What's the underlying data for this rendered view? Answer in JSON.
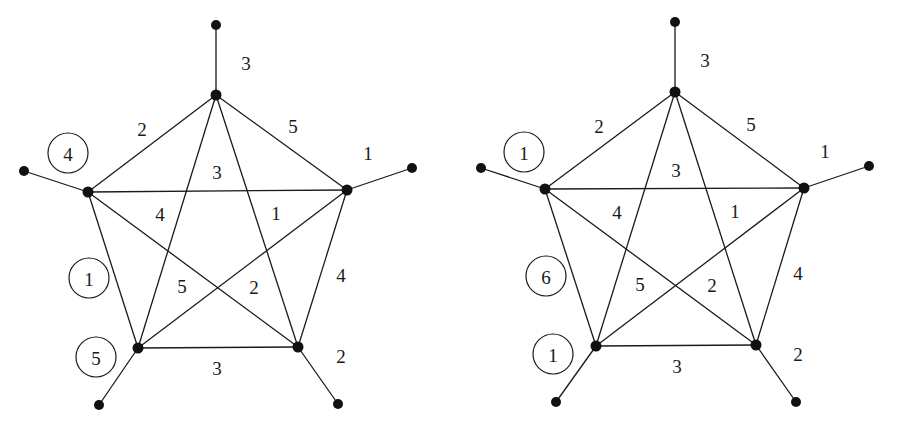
{
  "graphs": [
    {
      "name": "left",
      "vertices": {
        "T": [
          216,
          95
        ],
        "L": [
          88,
          192
        ],
        "R": [
          347,
          190
        ],
        "BL": [
          138,
          348
        ],
        "BR": [
          298,
          347
        ],
        "pT": [
          216,
          25
        ],
        "pL": [
          24,
          171
        ],
        "pR": [
          412,
          168
        ],
        "pBL": [
          99,
          405
        ],
        "pBR": [
          338,
          404
        ]
      },
      "edges": [
        {
          "a": "T",
          "b": "pT",
          "w": "3",
          "lx": 246,
          "ly": 63
        },
        {
          "a": "R",
          "b": "pR",
          "w": "1",
          "lx": 368,
          "ly": 153
        },
        {
          "a": "BR",
          "b": "pBR",
          "w": "2",
          "lx": 341,
          "ly": 356
        },
        {
          "a": "BL",
          "b": "pBL",
          "w": "",
          "lx": 0,
          "ly": 0
        },
        {
          "a": "L",
          "b": "pL",
          "w": "",
          "lx": 0,
          "ly": 0
        },
        {
          "a": "T",
          "b": "L",
          "w": "2",
          "lx": 142,
          "ly": 129
        },
        {
          "a": "T",
          "b": "R",
          "w": "5",
          "lx": 293,
          "ly": 126
        },
        {
          "a": "L",
          "b": "R",
          "w": "3",
          "lx": 217,
          "ly": 172
        },
        {
          "a": "L",
          "b": "BL",
          "w": "",
          "lx": 0,
          "ly": 0
        },
        {
          "a": "R",
          "b": "BR",
          "w": "4",
          "lx": 341,
          "ly": 275
        },
        {
          "a": "BL",
          "b": "BR",
          "w": "3",
          "lx": 217,
          "ly": 368
        },
        {
          "a": "T",
          "b": "BL",
          "w": "4",
          "lx": 160,
          "ly": 214
        },
        {
          "a": "T",
          "b": "BR",
          "w": "1",
          "lx": 276,
          "ly": 213
        },
        {
          "a": "L",
          "b": "BR",
          "w": "2",
          "lx": 254,
          "ly": 287
        },
        {
          "a": "R",
          "b": "BL",
          "w": "5",
          "lx": 182,
          "ly": 286
        }
      ],
      "circled": [
        {
          "value": "4",
          "cx": 68,
          "cy": 153
        },
        {
          "value": "1",
          "cx": 89,
          "cy": 278
        },
        {
          "value": "5",
          "cx": 96,
          "cy": 357
        }
      ]
    },
    {
      "name": "right",
      "vertices": {
        "T": [
          675,
          92
        ],
        "L": [
          545,
          189
        ],
        "R": [
          804,
          188
        ],
        "BL": [
          596,
          346
        ],
        "BR": [
          756,
          345
        ],
        "pT": [
          675,
          22
        ],
        "pL": [
          481,
          168
        ],
        "pR": [
          869,
          166
        ],
        "pBL": [
          556,
          402
        ],
        "pBR": [
          796,
          402
        ]
      },
      "edges": [
        {
          "a": "T",
          "b": "pT",
          "w": "3",
          "lx": 705,
          "ly": 60
        },
        {
          "a": "R",
          "b": "pR",
          "w": "1",
          "lx": 825,
          "ly": 151
        },
        {
          "a": "BR",
          "b": "pBR",
          "w": "2",
          "lx": 798,
          "ly": 354
        },
        {
          "a": "BL",
          "b": "pBL",
          "w": "",
          "lx": 0,
          "ly": 0
        },
        {
          "a": "L",
          "b": "pL",
          "w": "",
          "lx": 0,
          "ly": 0
        },
        {
          "a": "T",
          "b": "L",
          "w": "2",
          "lx": 599,
          "ly": 126
        },
        {
          "a": "T",
          "b": "R",
          "w": "5",
          "lx": 751,
          "ly": 124
        },
        {
          "a": "L",
          "b": "R",
          "w": "3",
          "lx": 676,
          "ly": 170
        },
        {
          "a": "L",
          "b": "BL",
          "w": "",
          "lx": 0,
          "ly": 0
        },
        {
          "a": "R",
          "b": "BR",
          "w": "4",
          "lx": 798,
          "ly": 273
        },
        {
          "a": "BL",
          "b": "BR",
          "w": "3",
          "lx": 677,
          "ly": 366
        },
        {
          "a": "T",
          "b": "BL",
          "w": "4",
          "lx": 617,
          "ly": 212
        },
        {
          "a": "T",
          "b": "BR",
          "w": "1",
          "lx": 735,
          "ly": 211
        },
        {
          "a": "L",
          "b": "BR",
          "w": "2",
          "lx": 712,
          "ly": 285
        },
        {
          "a": "R",
          "b": "BL",
          "w": "5",
          "lx": 640,
          "ly": 284
        }
      ],
      "circled": [
        {
          "value": "1",
          "cx": 524,
          "cy": 152
        },
        {
          "value": "6",
          "cx": 546,
          "cy": 276
        },
        {
          "value": "1",
          "cx": 553,
          "cy": 354
        }
      ]
    }
  ]
}
